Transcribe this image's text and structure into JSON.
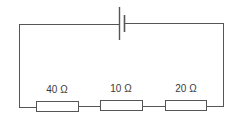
{
  "diagram": {
    "type": "series circuit",
    "wire_color": "#555555",
    "components": {
      "battery": {
        "symbol": "cell",
        "label": ""
      },
      "resistors": [
        {
          "label": "40 Ω",
          "value_ohms": 40
        },
        {
          "label": "10 Ω",
          "value_ohms": 10
        },
        {
          "label": "20 Ω",
          "value_ohms": 20
        }
      ]
    }
  }
}
